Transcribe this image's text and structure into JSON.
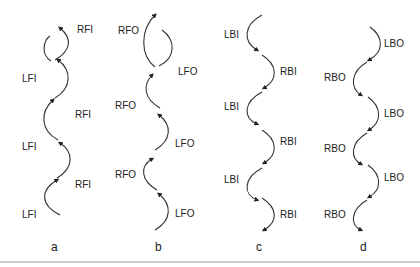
{
  "diagram": {
    "type": "sequence-of-curved-arrows",
    "columns": [
      {
        "caption": "a",
        "direction": "up",
        "steps": [
          {
            "label": "LFI",
            "side": "left"
          },
          {
            "label": "RFI",
            "side": "right"
          },
          {
            "label": "LFI",
            "side": "left"
          },
          {
            "label": "RFI",
            "side": "right"
          },
          {
            "label": "LFI",
            "side": "left"
          },
          {
            "label": "RFI",
            "side": "right"
          }
        ]
      },
      {
        "caption": "b",
        "direction": "up",
        "steps": [
          {
            "label": "LFO",
            "side": "right"
          },
          {
            "label": "RFO",
            "side": "left"
          },
          {
            "label": "LFO",
            "side": "right"
          },
          {
            "label": "RFO",
            "side": "left"
          },
          {
            "label": "LFO",
            "side": "right"
          },
          {
            "label": "RFO",
            "side": "left"
          }
        ]
      },
      {
        "caption": "c",
        "direction": "down",
        "steps": [
          {
            "label": "LBI",
            "side": "left"
          },
          {
            "label": "RBI",
            "side": "right"
          },
          {
            "label": "LBI",
            "side": "left"
          },
          {
            "label": "RBI",
            "side": "right"
          },
          {
            "label": "LBI",
            "side": "left"
          },
          {
            "label": "RBI",
            "side": "right"
          }
        ]
      },
      {
        "caption": "d",
        "direction": "down",
        "steps": [
          {
            "label": "LBO",
            "side": "right"
          },
          {
            "label": "RBO",
            "side": "left"
          },
          {
            "label": "LBO",
            "side": "right"
          },
          {
            "label": "RBO",
            "side": "left"
          },
          {
            "label": "LBO",
            "side": "right"
          },
          {
            "label": "RBO",
            "side": "left"
          }
        ]
      }
    ]
  },
  "labels": {
    "a": [
      "RFI",
      "LFI",
      "RFI",
      "LFI",
      "RFI",
      "LFI"
    ],
    "b": [
      "RFO",
      "LFO",
      "RFO",
      "LFO",
      "RFO",
      "LFO"
    ],
    "c": [
      "LBI",
      "RBI",
      "LBI",
      "RBI",
      "LBI",
      "RBI"
    ],
    "d": [
      "LBO",
      "RBO",
      "LBO",
      "RBO",
      "LBO",
      "RBO"
    ]
  },
  "captions": [
    "a",
    "b",
    "c",
    "d"
  ]
}
